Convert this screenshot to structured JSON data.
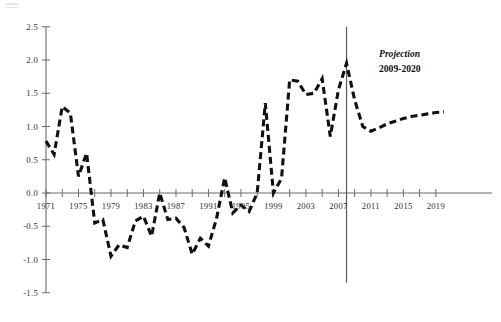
{
  "figure": {
    "background_color": "#ffffff",
    "line_color": "#111111",
    "axis_color": "#6b6b6b"
  },
  "annotation": {
    "title": "Projection",
    "subtitle": "2009-2020"
  },
  "chart_data": {
    "type": "line",
    "title": "",
    "subtitle": "",
    "xlabel": "",
    "ylabel": "",
    "xlim": [
      1971,
      2020
    ],
    "ylim": [
      -1.5,
      2.5
    ],
    "grid": false,
    "legend": "none",
    "line_style": "dashed",
    "y_ticks": [
      2.5,
      2.0,
      1.5,
      1.0,
      0.5,
      0.0,
      -0.5,
      -1.0,
      -1.5
    ],
    "y_tick_labels": [
      "2.5",
      "2.0",
      "1.5",
      "1.0",
      "0.5",
      "0.0",
      "-0.5",
      "-1.0",
      "-1.5"
    ],
    "x_ticks": [
      1971,
      1973,
      1975,
      1977,
      1979,
      1981,
      1983,
      1985,
      1987,
      1989,
      1991,
      1993,
      1995,
      1997,
      1999,
      2001,
      2003,
      2005,
      2007,
      2009,
      2011,
      2013,
      2015,
      2017,
      2019
    ],
    "x_tick_labels_shown": [
      "1971",
      "1975",
      "1979",
      "1983",
      "1987",
      "1991",
      "1995",
      "1999",
      "2003",
      "2007",
      "2011",
      "2015",
      "2019"
    ],
    "x_labeled_years": [
      1971,
      1975,
      1979,
      1983,
      1987,
      1991,
      1995,
      1999,
      2003,
      2007,
      2011,
      2015,
      2019
    ],
    "annotations": [
      {
        "text": "Projection",
        "x": 2012,
        "y": 2.05,
        "style": "bold-italic"
      },
      {
        "text": "2009-2020",
        "x": 2012,
        "y": 1.82,
        "style": "bold"
      }
    ],
    "vertical_marker": {
      "x": 2008,
      "y_from": -1.35,
      "y_to": 2.5
    },
    "x": [
      1971,
      1972,
      1973,
      1974,
      1975,
      1976,
      1977,
      1978,
      1979,
      1980,
      1981,
      1982,
      1983,
      1984,
      1985,
      1986,
      1987,
      1988,
      1989,
      1990,
      1991,
      1992,
      1993,
      1994,
      1995,
      1996,
      1997,
      1998,
      1999,
      2000,
      2001,
      2002,
      2003,
      2004,
      2005,
      2006,
      2007,
      2008,
      2009,
      2010,
      2011,
      2012,
      2013,
      2014,
      2015,
      2016,
      2017,
      2018,
      2019,
      2020
    ],
    "series": [
      {
        "name": "Historical and projected series",
        "values": [
          0.78,
          0.58,
          1.3,
          1.2,
          0.25,
          0.6,
          -0.45,
          -0.4,
          -0.95,
          -0.78,
          -0.82,
          -0.42,
          -0.35,
          -0.65,
          0.0,
          -0.4,
          -0.38,
          -0.52,
          -0.92,
          -0.68,
          -0.8,
          -0.38,
          0.23,
          -0.3,
          -0.18,
          -0.28,
          0.0,
          1.35,
          0.0,
          0.22,
          1.7,
          1.68,
          1.48,
          1.5,
          1.72,
          0.85,
          1.55,
          1.95,
          1.4,
          1.0,
          0.93,
          0.98,
          1.04,
          1.08,
          1.12,
          1.15,
          1.17,
          1.19,
          1.21,
          1.22
        ]
      }
    ],
    "projection_start_year": 2009,
    "projection_end_year": 2020
  }
}
